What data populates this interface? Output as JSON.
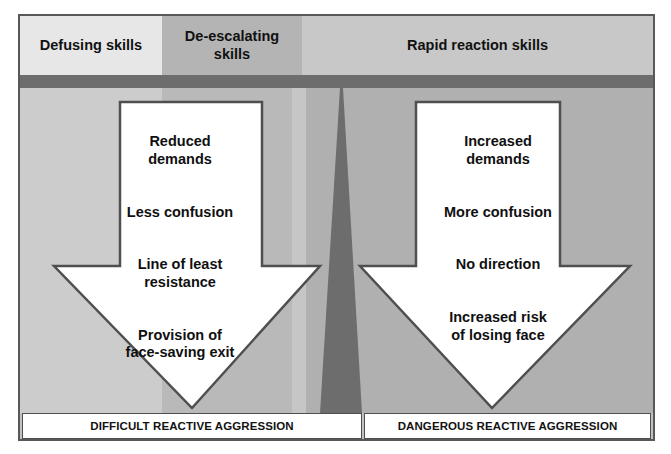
{
  "diagram": {
    "header": {
      "segments": [
        {
          "id": "defusing",
          "label": "Defusing skills",
          "color": "#e7e7e7"
        },
        {
          "id": "de-escalating",
          "label": "De-escalating\nskills",
          "color": "#b4b4b4"
        },
        {
          "id": "rapid",
          "label": "Rapid reaction skills",
          "color": "#c8c8c8"
        }
      ]
    },
    "divider": {
      "color": "#6d6d6d"
    },
    "center_wedge": {
      "name": "escalation-wedge",
      "color": "#6d6d6d"
    },
    "arrows": [
      {
        "id": "left-arrow",
        "name": "difficult-outcome-arrow",
        "direction": "down",
        "fill": "#ffffff",
        "stroke": "#4f4f4f",
        "lines": [
          "Reduced\ndemands",
          "Less confusion",
          "Line of least\nresistance",
          "Provision of\nface-saving exit"
        ]
      },
      {
        "id": "right-arrow",
        "name": "dangerous-outcome-arrow",
        "direction": "down",
        "fill": "#ffffff",
        "stroke": "#4f4f4f",
        "lines": [
          "Increased\ndemands",
          "More confusion",
          "No direction",
          "Increased risk\nof losing face"
        ]
      }
    ],
    "footer": {
      "boxes": [
        {
          "id": "difficult",
          "label": "DIFFICULT REACTIVE AGGRESSION"
        },
        {
          "id": "dangerous",
          "label": "DANGEROUS REACTIVE AGGRESSION"
        }
      ]
    },
    "bands": [
      {
        "id": "band-a",
        "color": "#cccccc"
      },
      {
        "id": "band-b",
        "color": "#b9b9b9"
      },
      {
        "id": "band-c",
        "color": "#c6c6c6"
      },
      {
        "id": "band-d",
        "color": "#b0b0b0"
      }
    ],
    "frame": {
      "border_color": "#585858",
      "background": "#c2c2c2"
    }
  }
}
